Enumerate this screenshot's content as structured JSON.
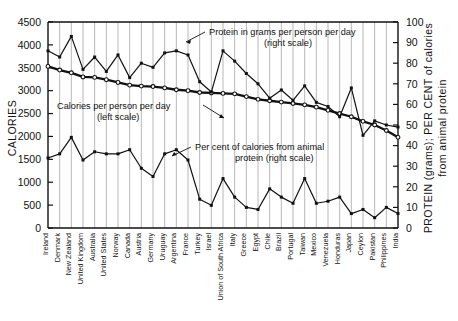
{
  "chart_data": {
    "type": "line",
    "title": "",
    "categories": [
      "Ireland",
      "Denmark",
      "New Zealand",
      "United Kingdom",
      "Australia",
      "United States",
      "Norway",
      "Canada",
      "Austria",
      "Germany",
      "Uruguay",
      "Argentina",
      "France",
      "Turkey",
      "Israel",
      "Union of South Africa",
      "Italy",
      "Greece",
      "Egypt",
      "Chile",
      "Brazil",
      "Portugal",
      "Taiwan",
      "Mexico",
      "Venezuela",
      "Honduras",
      "Japan",
      "Ceylon",
      "Pakistan",
      "Philippines",
      "India"
    ],
    "ylabel": "CALORIES",
    "ylabel_right_line1": "PROTEIN (grams); PER CENT of calories",
    "ylabel_right_line2": "from animal protein",
    "ylim": [
      0,
      4500
    ],
    "yticks": [
      0,
      500,
      1000,
      1500,
      2000,
      2500,
      3000,
      3500,
      4000,
      4500
    ],
    "ylim_right": [
      0,
      100
    ],
    "yticks_right": [
      0,
      10,
      20,
      30,
      40,
      50,
      60,
      70,
      80,
      90,
      100
    ],
    "grid": true,
    "legend_position": "inline-annotations",
    "series": [
      {
        "name": "Calories per person per day",
        "scale": "left",
        "marker": "open-circle",
        "values": [
          3530,
          3450,
          3390,
          3300,
          3290,
          3240,
          3180,
          3120,
          3100,
          3090,
          3060,
          3020,
          3000,
          2960,
          2950,
          2940,
          2930,
          2870,
          2810,
          2780,
          2750,
          2720,
          2690,
          2640,
          2570,
          2500,
          2430,
          2330,
          2250,
          2130,
          1980
        ]
      },
      {
        "name": "Protein in grams per person per day",
        "scale": "right",
        "marker": "filled-square",
        "values": [
          86,
          83,
          93,
          77,
          83,
          76,
          84,
          73,
          80,
          78,
          85,
          86,
          84,
          71,
          66,
          86,
          81,
          75,
          70,
          63,
          67,
          62,
          69,
          61,
          59,
          54,
          68,
          45,
          52,
          50,
          49
        ]
      },
      {
        "name": "Per cent of calories from animal protein",
        "scale": "right",
        "marker": "filled-square",
        "values": [
          34,
          36,
          44,
          33,
          37,
          36,
          36,
          38,
          29,
          25,
          36,
          38,
          33,
          14,
          11,
          24,
          15,
          10,
          9,
          19,
          15,
          12,
          24,
          12,
          13,
          15,
          7,
          9,
          5,
          10,
          7
        ]
      }
    ],
    "annotations": [
      {
        "name": "protein-annotation",
        "line1": "Protein in grams per person per day",
        "line2": "(right scale)"
      },
      {
        "name": "calories-annotation",
        "line1": "Calories per person per day",
        "line2": "(left scale)"
      },
      {
        "name": "animal-protein-annotation",
        "line1": "Per cent of calories from animal",
        "line2": "protein (right scale)"
      }
    ],
    "colors": {
      "ink": "#111111",
      "grid": "#9a9a9a",
      "background": "#ffffff"
    }
  }
}
